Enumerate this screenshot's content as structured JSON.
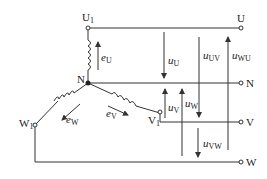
{
  "diagram": {
    "colors": {
      "line": "#333333",
      "background": "#ffffff"
    },
    "terminals": {
      "U1": "U",
      "U1_sub": "1",
      "V1": "V",
      "V1_sub": "1",
      "W1": "W",
      "W1_sub": "1",
      "N_junction": "N",
      "U": "U",
      "N": "N",
      "V": "V",
      "W": "W"
    },
    "emf": {
      "eU": {
        "sym": "e",
        "sub": "U"
      },
      "eV": {
        "sym": "e",
        "sub": "V"
      },
      "eW": {
        "sym": "e",
        "sub": "W"
      }
    },
    "voltages": {
      "uU": {
        "sym": "u",
        "sub": "U"
      },
      "uV": {
        "sym": "u",
        "sub": "V"
      },
      "uW": {
        "sym": "u",
        "sub": "W"
      },
      "uUV": {
        "sym": "u",
        "sub": "UV"
      },
      "uVW": {
        "sym": "u",
        "sub": "VW"
      },
      "uWU": {
        "sym": "u",
        "sub": "WU"
      }
    }
  }
}
